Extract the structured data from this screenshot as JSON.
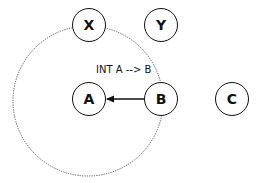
{
  "diagram": {
    "nodes": [
      {
        "id": "X",
        "label": "X",
        "cx": 89,
        "cy": 25
      },
      {
        "id": "Y",
        "label": "Y",
        "cx": 161,
        "cy": 25
      },
      {
        "id": "A",
        "label": "A",
        "cx": 89,
        "cy": 99
      },
      {
        "id": "B",
        "label": "B",
        "cx": 161,
        "cy": 99
      },
      {
        "id": "C",
        "label": "C",
        "cx": 232,
        "cy": 99
      }
    ],
    "edges": [
      {
        "from": "B",
        "to": "A",
        "label": "INT A --> B",
        "style": "solid",
        "arrow": "end"
      }
    ],
    "regions": [
      {
        "shape": "circle",
        "style": "dotted",
        "cx": 88,
        "cy": 101,
        "r": 75,
        "contains": [
          "X",
          "A",
          "B"
        ]
      }
    ],
    "colors": {
      "stroke": "#111111",
      "dotted": "#555555",
      "background": "#ffffff"
    }
  }
}
